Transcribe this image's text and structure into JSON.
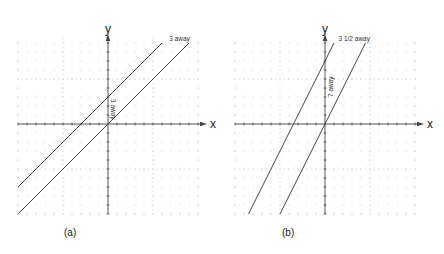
{
  "panels": [
    {
      "id": "a",
      "caption": "(a)",
      "x_axis_label": "x",
      "y_axis_label": "y",
      "origin_px": [
        108,
        124
      ],
      "grid_px": 9,
      "lines": [
        {
          "equation": "y = x",
          "slope": 1,
          "intercept": 0
        },
        {
          "equation": "y = x + 3",
          "slope": 1,
          "intercept": 3
        }
      ],
      "annotations": {
        "top": "3 away",
        "vertical": "3 away"
      }
    },
    {
      "id": "b",
      "caption": "(b)",
      "x_axis_label": "x",
      "y_axis_label": "y",
      "origin_px": [
        325,
        124
      ],
      "grid_px": 9,
      "lines": [
        {
          "equation": "y = 2x",
          "slope": 2,
          "intercept": 0
        },
        {
          "equation": "y = 2x + 7",
          "slope": 2,
          "intercept": 7
        }
      ],
      "annotations": {
        "top": "3 1/2 away",
        "vertical": "7 away"
      }
    }
  ],
  "colors": {
    "line": "#333333",
    "grid_dot": "#999999",
    "axis": "#444444"
  }
}
